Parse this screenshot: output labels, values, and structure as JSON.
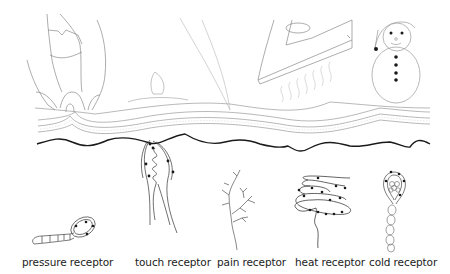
{
  "diagram": {
    "stimuli": [
      {
        "id": "finger-press",
        "icon": "fingers-pressing-icon",
        "description": "fingers pressing into skin"
      },
      {
        "id": "candle",
        "icon": "candle-flame-icon",
        "description": "candle flame on skin"
      },
      {
        "id": "needle",
        "icon": "needle-icon",
        "description": "sharp point touching skin"
      },
      {
        "id": "iron",
        "icon": "iron-icon",
        "description": "hot iron with steam"
      },
      {
        "id": "snowman",
        "icon": "snowman-icon",
        "description": "snowman with hat"
      }
    ],
    "receptors": [
      {
        "label": "pressure receptor",
        "x": 22
      },
      {
        "label": "touch receptor",
        "x": 135
      },
      {
        "label": "pain receptor",
        "x": 217
      },
      {
        "label": "heat receptor",
        "x": 295
      },
      {
        "label": "cold receptor",
        "x": 369
      }
    ],
    "colors": {
      "outline_light": "#9a9a9a",
      "outline_dark": "#1a1a1a",
      "text": "#222222",
      "background": "#ffffff"
    }
  }
}
